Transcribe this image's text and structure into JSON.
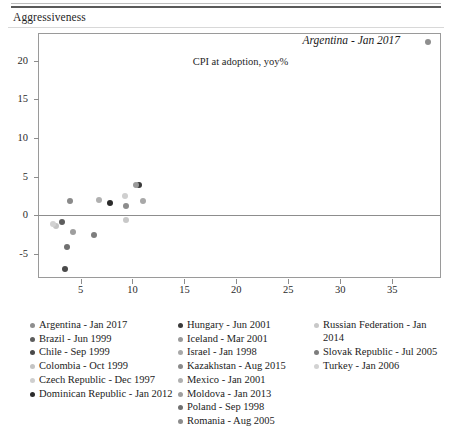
{
  "panel": {
    "title": "Aggressiveness"
  },
  "chart_data": {
    "type": "scatter",
    "title": "Aggressiveness",
    "xlabel": "CPI at adoption, yoy%",
    "ylabel": "",
    "xlim": [
      1.0,
      39.8
    ],
    "ylim": [
      -8.3,
      23.5
    ],
    "xticks": [
      5,
      10,
      15,
      20,
      25,
      30,
      35
    ],
    "yticks": [
      -5,
      0,
      5,
      10,
      15,
      20
    ],
    "grid": false,
    "zero_line": true,
    "legend_position": "bottom",
    "annotations": [
      {
        "text": "Argentina - Jan 2017",
        "x": 38.5,
        "y": 22.4,
        "style": "italic",
        "marker_color": "#8e8e8e"
      }
    ],
    "points": [
      {
        "label": "Argentina - Jan 2017",
        "x": 38.5,
        "y": 22.4,
        "color": "#8e8e8e"
      },
      {
        "label": "Brazil - Jun 1999",
        "x": 3.2,
        "y": -0.9,
        "color": "#5d5d5d"
      },
      {
        "label": "Chile - Sep 1999",
        "x": 3.5,
        "y": -7.0,
        "color": "#4a4a4a"
      },
      {
        "label": "Colombia - Oct 1999",
        "x": 2.6,
        "y": -1.4,
        "color": "#c4c4c4"
      },
      {
        "label": "Czech Republic - Dec 1997",
        "x": 9.3,
        "y": 2.5,
        "color": "#cfcfcf"
      },
      {
        "label": "Dominican Republic - Jan 2012",
        "x": 7.8,
        "y": 1.5,
        "color": "#2b2b2b"
      },
      {
        "label": "Hungary - Jun 2001",
        "x": 10.6,
        "y": 3.9,
        "color": "#3a3a3a"
      },
      {
        "label": "Iceland - Mar 2001",
        "x": 10.3,
        "y": 3.9,
        "color": "#9a9a9a"
      },
      {
        "label": "Israel - Jan 1998",
        "x": 11.0,
        "y": 1.8,
        "color": "#a8a8a8"
      },
      {
        "label": "Kazakhstan - Aug 2015",
        "x": 4.0,
        "y": 1.8,
        "color": "#8a8a8a"
      },
      {
        "label": "Mexico - Jan 2001",
        "x": 6.8,
        "y": 2.0,
        "color": "#b0b0b0"
      },
      {
        "label": "Moldova - Jan 2013",
        "x": 4.3,
        "y": -2.2,
        "color": "#9e9e9e"
      },
      {
        "label": "Poland - Sep 1998",
        "x": 3.7,
        "y": -4.1,
        "color": "#707070"
      },
      {
        "label": "Romania - Aug 2005",
        "x": 9.4,
        "y": 1.2,
        "color": "#8c8c8c"
      },
      {
        "label": "Russian Federation - Jan 2014",
        "x": 9.4,
        "y": -0.6,
        "color": "#c8c8c8"
      },
      {
        "label": "Slovak Republic - Jul 2005",
        "x": 6.3,
        "y": -2.6,
        "color": "#7d7d7d"
      },
      {
        "label": "Turkey - Jan 2006",
        "x": 2.3,
        "y": -1.1,
        "color": "#d2d2d2"
      }
    ]
  },
  "legend": {
    "columns": [
      [
        {
          "label": "Argentina - Jan 2017",
          "color": "#8e8e8e"
        },
        {
          "label": "Brazil - Jun 1999",
          "color": "#5d5d5d"
        },
        {
          "label": "Chile - Sep 1999",
          "color": "#4a4a4a"
        },
        {
          "label": "Colombia - Oct 1999",
          "color": "#c4c4c4"
        },
        {
          "label": "Czech Republic - Dec 1997",
          "color": "#cfcfcf"
        },
        {
          "label": "Dominican Republic - Jan 2012",
          "color": "#2b2b2b"
        }
      ],
      [
        {
          "label": "Hungary - Jun 2001",
          "color": "#3a3a3a"
        },
        {
          "label": "Iceland - Mar 2001",
          "color": "#9a9a9a"
        },
        {
          "label": "Israel - Jan 1998",
          "color": "#a8a8a8"
        },
        {
          "label": "Kazakhstan - Aug 2015",
          "color": "#8a8a8a"
        },
        {
          "label": "Mexico - Jan 2001",
          "color": "#b0b0b0"
        },
        {
          "label": "Moldova - Jan 2013",
          "color": "#9e9e9e"
        },
        {
          "label": "Poland - Sep 1998",
          "color": "#707070"
        },
        {
          "label": "Romania - Aug 2005",
          "color": "#8c8c8c"
        }
      ],
      [
        {
          "label": "Russian Federation - Jan 2014",
          "color": "#c8c8c8"
        },
        {
          "label": "Slovak Republic - Jul 2005",
          "color": "#7d7d7d"
        },
        {
          "label": "Turkey - Jan 2006",
          "color": "#d2d2d2"
        }
      ]
    ]
  }
}
